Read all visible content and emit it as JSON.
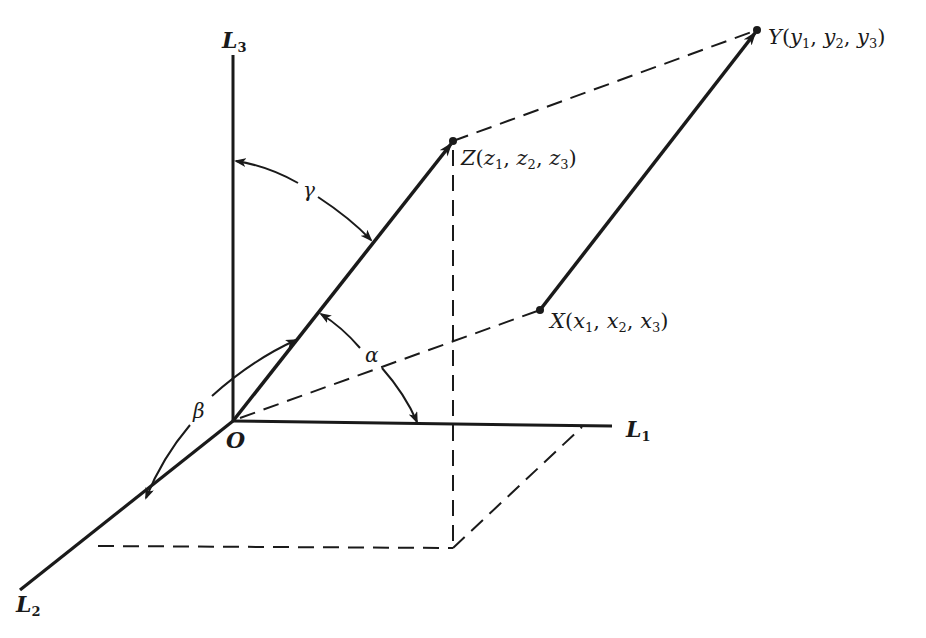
{
  "figure": {
    "type": "3D coordinate axes with vectors and direction angles",
    "stroke_color": "#1a1a1a",
    "background": "#ffffff",
    "origin": {
      "label": "O",
      "x": 233,
      "y": 421
    },
    "axes": [
      {
        "id": "L1",
        "base": "L",
        "sub": "1",
        "from": [
          233,
          421
        ],
        "to": [
          612,
          426
        ],
        "label_pos": [
          624,
          436
        ]
      },
      {
        "id": "L2",
        "base": "L",
        "sub": "2",
        "from": [
          233,
          421
        ],
        "to": [
          20,
          590
        ],
        "label_pos": [
          14,
          612
        ]
      },
      {
        "id": "L3",
        "base": "L",
        "sub": "3",
        "from": [
          233,
          421
        ],
        "to": [
          233,
          55
        ],
        "label_pos": [
          226,
          48
        ]
      }
    ],
    "points": {
      "Z": {
        "name": "Z",
        "coord_letter": "z",
        "x": 453,
        "y": 141,
        "label": "Z(z1, z2, z3)",
        "label_pos": [
          460,
          165
        ]
      },
      "Y": {
        "name": "Y",
        "coord_letter": "y",
        "x": 757,
        "y": 30,
        "label": "Y(y1, y2, y3)",
        "label_pos": [
          768,
          44
        ]
      },
      "X": {
        "name": "X",
        "coord_letter": "x",
        "x": 540,
        "y": 310,
        "label": "X(x1, x2, x3)",
        "label_pos": [
          550,
          328
        ]
      }
    },
    "vectors": [
      {
        "id": "OZ",
        "from": "O",
        "to": "Z",
        "style": "solid-arrow"
      },
      {
        "id": "XY",
        "from": "X",
        "to": "Y",
        "style": "solid-arrow"
      }
    ],
    "dashed_lines": [
      {
        "id": "Z-Y",
        "from": [
          453,
          141
        ],
        "to": [
          757,
          30
        ]
      },
      {
        "id": "O-X",
        "from": [
          233,
          421
        ],
        "to": [
          540,
          310
        ]
      },
      {
        "id": "Z-drop",
        "from": [
          453,
          141
        ],
        "to": [
          453,
          548
        ]
      },
      {
        "id": "base-front",
        "from": [
          98,
          546
        ],
        "to": [
          453,
          548
        ]
      },
      {
        "id": "base-right",
        "from": [
          453,
          548
        ],
        "to": [
          582,
          427
        ]
      }
    ],
    "angles": [
      {
        "id": "gamma",
        "symbol": "γ",
        "between": [
          "L3",
          "OZ"
        ],
        "label_pos": [
          304,
          197
        ]
      },
      {
        "id": "alpha",
        "symbol": "α",
        "between": [
          "OZ",
          "L1"
        ],
        "label_pos": [
          366,
          362
        ]
      },
      {
        "id": "beta",
        "symbol": "β",
        "between": [
          "OZ",
          "L2"
        ],
        "label_pos": [
          194,
          418
        ]
      }
    ]
  },
  "labels": {
    "origin": "O",
    "L1_base": "L",
    "L1_sub": "1",
    "L2_base": "L",
    "L2_sub": "2",
    "L3_base": "L",
    "L3_sub": "3",
    "Z_name": "Z",
    "Z_open": "(",
    "Z_c": "z",
    "Z_s1": "1",
    "Z_s2": "2",
    "Z_s3": "3",
    "sep": ", ",
    "close": ")",
    "Y_name": "Y",
    "Y_c": "y",
    "Y_s1": "1",
    "Y_s2": "2",
    "Y_s3": "3",
    "X_name": "X",
    "X_c": "x",
    "X_s1": "1",
    "X_s2": "2",
    "X_s3": "3",
    "gamma": "γ",
    "alpha": "α",
    "beta": "β"
  }
}
